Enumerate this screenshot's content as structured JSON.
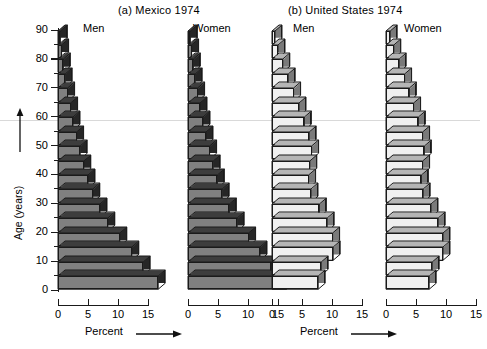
{
  "figure": {
    "panel_a_title": "(a)  Mexico 1974",
    "panel_b_title": "(b)  United States 1974",
    "men_label": "Men",
    "women_label": "Women",
    "y_axis_title": "Age (years)",
    "x_axis_title": "Percent",
    "colors": {
      "mexico_bar_face": "#808080",
      "mexico_bar_side": "#262626",
      "mexico_bar_top": "#3d3d3d",
      "us_bar_face": "#f0f0f0",
      "us_bar_side": "#7a7a7a",
      "us_bar_top": "#b5b5b5",
      "outline": "#1b1b1b",
      "rule": "#d9d9d9",
      "background": "#ffffff"
    }
  },
  "chart_data": {
    "type": "bar",
    "xlabel": "Percent",
    "ylabel": "Age (years)",
    "xlim": [
      0,
      18
    ],
    "ylim": [
      0,
      92
    ],
    "grid": false,
    "legend": "none",
    "x_ticks": [
      0,
      5,
      10,
      15
    ],
    "x_tick_labels": [
      "0",
      "5",
      "10",
      "15"
    ],
    "y_ticks": [
      0,
      10,
      20,
      30,
      40,
      50,
      60,
      70,
      80,
      90
    ],
    "y_tick_labels": [
      "0",
      "10",
      "20",
      "30",
      "40",
      "50",
      "60",
      "70",
      "80",
      "90"
    ],
    "y_minor_ticks": [
      5,
      15,
      25,
      35,
      45,
      55,
      65,
      75,
      85
    ],
    "age_groups": [
      "0-4",
      "5-9",
      "10-14",
      "15-19",
      "20-24",
      "25-29",
      "30-34",
      "35-39",
      "40-44",
      "45-49",
      "50-54",
      "55-59",
      "60-64",
      "65-69",
      "70-74",
      "75-79",
      "80-84",
      "85-89"
    ],
    "panels": [
      {
        "name": "Mexico 1974",
        "label": "(a)  Mexico 1974",
        "series": [
          {
            "name": "Men",
            "values": [
              16.7,
              14.2,
              12.3,
              10.3,
              8.3,
              7.0,
              5.8,
              5.0,
              4.3,
              3.7,
              3.1,
              2.5,
              2.1,
              1.6,
              1.2,
              0.9,
              0.6,
              0.4
            ]
          },
          {
            "name": "Women",
            "values": [
              16.4,
              13.9,
              12.0,
              10.1,
              8.2,
              6.9,
              5.7,
              4.9,
              4.2,
              3.6,
              3.0,
              2.5,
              2.0,
              1.6,
              1.2,
              0.9,
              0.6,
              0.4
            ]
          }
        ]
      },
      {
        "name": "United States 1974",
        "label": "(b)  United States 1974",
        "series": [
          {
            "name": "Men",
            "values": [
              7.7,
              8.2,
              10.2,
              10.1,
              9.2,
              7.9,
              6.5,
              6.1,
              6.3,
              6.6,
              6.2,
              5.4,
              4.5,
              3.6,
              2.7,
              1.8,
              1.0,
              0.5
            ]
          },
          {
            "name": "Women",
            "values": [
              7.2,
              7.7,
              9.5,
              9.5,
              8.7,
              7.5,
              6.2,
              5.9,
              6.1,
              6.4,
              6.1,
              5.4,
              4.6,
              3.9,
              3.1,
              2.2,
              1.3,
              0.7
            ]
          }
        ]
      }
    ]
  }
}
